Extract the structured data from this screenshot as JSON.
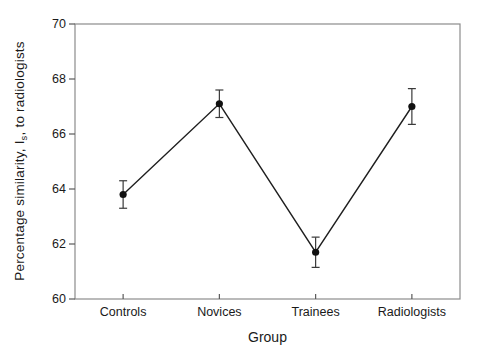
{
  "figure": {
    "xlabel": "Group",
    "ylabel_pre": "Percentage similarity, I",
    "ylabel_sub": "s",
    "ylabel_post": ", to radiologists"
  },
  "chart_data": {
    "type": "line",
    "categories": [
      "Controls",
      "Novices",
      "Trainees",
      "Radiologists"
    ],
    "series": [
      {
        "name": "Percentage similarity to radiologists",
        "values": [
          63.8,
          67.1,
          61.7,
          67.0
        ],
        "errors": [
          0.5,
          0.5,
          0.55,
          0.65
        ]
      }
    ],
    "title": "",
    "xlabel": "Group",
    "ylabel": "Percentage similarity, Is, to radiologists",
    "ylim": [
      60,
      70
    ],
    "yticks": [
      60,
      62,
      64,
      66,
      68,
      70
    ],
    "grid": false,
    "legend": "none",
    "marker": "filled-circle",
    "error_bars": true,
    "frame": "full-box",
    "colors": {
      "frame": "#8c8c8c",
      "tick": "#5a5a5a",
      "line": "#1f1f1f",
      "marker": "#111111",
      "error": "#3a3a3a",
      "text": "#1a1a1a"
    }
  }
}
